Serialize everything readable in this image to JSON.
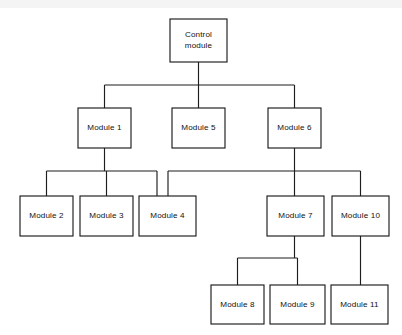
{
  "diagram": {
    "type": "structure-chart",
    "canvas": {
      "width": 402,
      "height": 335
    },
    "colors": {
      "background": "#ffffff",
      "box_fill": "#ffffff",
      "line": "#1d1d1d",
      "text": "#111111"
    },
    "nodes": [
      {
        "id": "control",
        "label": "Control module",
        "lines": [
          "Control",
          "module"
        ],
        "x": 170,
        "y": 19,
        "w": 57,
        "h": 43,
        "level": 0
      },
      {
        "id": "m1",
        "label": "Module 1",
        "lines": [
          "Module 1"
        ],
        "x": 78,
        "y": 108,
        "w": 53,
        "h": 40,
        "level": 1
      },
      {
        "id": "m5",
        "label": "Module 5",
        "lines": [
          "Module 5"
        ],
        "x": 172,
        "y": 108,
        "w": 53,
        "h": 40,
        "level": 1
      },
      {
        "id": "m6",
        "label": "Module 6",
        "lines": [
          "Module 6"
        ],
        "x": 268,
        "y": 108,
        "w": 53,
        "h": 40,
        "level": 1
      },
      {
        "id": "m2",
        "label": "Module 2",
        "lines": [
          "Module 2"
        ],
        "x": 20,
        "y": 196,
        "w": 53,
        "h": 40,
        "level": 2
      },
      {
        "id": "m3",
        "label": "Module 3",
        "lines": [
          "Module 3"
        ],
        "x": 80,
        "y": 196,
        "w": 53,
        "h": 40,
        "level": 2
      },
      {
        "id": "m4",
        "label": "Module 4",
        "lines": [
          "Module 4"
        ],
        "x": 139,
        "y": 196,
        "w": 57,
        "h": 40,
        "level": 2
      },
      {
        "id": "m7",
        "label": "Module 7",
        "lines": [
          "Module 7"
        ],
        "x": 267,
        "y": 196,
        "w": 57,
        "h": 40,
        "level": 2
      },
      {
        "id": "m10",
        "label": "Module 10",
        "lines": [
          "Module 10"
        ],
        "x": 332,
        "y": 196,
        "w": 57,
        "h": 40,
        "level": 2
      },
      {
        "id": "m8",
        "label": "Module 8",
        "lines": [
          "Module 8"
        ],
        "x": 211,
        "y": 285,
        "w": 53,
        "h": 39,
        "level": 3
      },
      {
        "id": "m9",
        "label": "Module 9",
        "lines": [
          "Module 9"
        ],
        "x": 270,
        "y": 285,
        "w": 55,
        "h": 39,
        "level": 3
      },
      {
        "id": "m11",
        "label": "Module 11",
        "lines": [
          "Module 11"
        ],
        "x": 331,
        "y": 285,
        "w": 57,
        "h": 39,
        "level": 3
      }
    ],
    "edges": [
      {
        "from": "control",
        "to": "m1"
      },
      {
        "from": "control",
        "to": "m5"
      },
      {
        "from": "control",
        "to": "m6"
      },
      {
        "from": "m1",
        "to": "m2"
      },
      {
        "from": "m1",
        "to": "m3"
      },
      {
        "from": "m1",
        "to": "m4"
      },
      {
        "from": "m6",
        "to": "m4"
      },
      {
        "from": "m6",
        "to": "m7"
      },
      {
        "from": "m6",
        "to": "m10"
      },
      {
        "from": "m7",
        "to": "m8"
      },
      {
        "from": "m7",
        "to": "m9"
      },
      {
        "from": "m10",
        "to": "m11"
      }
    ],
    "connector_paths": {
      "control_stem": "M 198.5 62 L 198.5 85",
      "row1_bus": "M 104.5 85 L 294.5 85",
      "m1_riser": "M 104.5 85 L 104.5 108",
      "m5_riser": "M 198.5 85 L 198.5 108",
      "m6_riser": "M 294.5 85 L 294.5 108",
      "m1_stem": "M 104.5 148 L 104.5 171",
      "m1_bus": "M 46.5 171 L 157 171",
      "m2_riser": "M 46.5 171 L 46.5 196",
      "m3_riser": "M 106.5 171 L 106.5 196",
      "m4_riser_left": "M 157 171 L 157 196",
      "m6_stem": "M 294.5 148 L 294.5 196",
      "m6_bus": "M 168 171 L 360.5 171",
      "m4_riser_right": "M 168 171 L 168 196",
      "m10_riser": "M 360.5 171 L 360.5 196",
      "m7_stem": "M 294.5 236 L 294.5 258",
      "m7_bus": "M 237.5 258 L 297.5 258",
      "m8_riser": "M 237.5 258 L 237.5 285",
      "m9_riser": "M 297.5 258 L 297.5 285",
      "m10_stem": "M 360.5 236 L 360.5 285"
    }
  }
}
